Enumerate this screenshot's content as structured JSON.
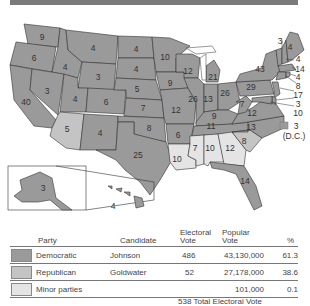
{
  "map": {
    "states": [
      {
        "name": "WA",
        "ev": "9"
      },
      {
        "name": "OR",
        "ev": "6"
      },
      {
        "name": "CA",
        "ev": "40"
      },
      {
        "name": "ID",
        "ev": "4"
      },
      {
        "name": "NV",
        "ev": "3"
      },
      {
        "name": "MT",
        "ev": "4"
      },
      {
        "name": "WY",
        "ev": "3"
      },
      {
        "name": "UT",
        "ev": "4"
      },
      {
        "name": "AZ",
        "ev": "5"
      },
      {
        "name": "CO",
        "ev": "6"
      },
      {
        "name": "NM",
        "ev": "4"
      },
      {
        "name": "ND",
        "ev": "4"
      },
      {
        "name": "SD",
        "ev": "4"
      },
      {
        "name": "NE",
        "ev": "5"
      },
      {
        "name": "KS",
        "ev": "7"
      },
      {
        "name": "OK",
        "ev": "8"
      },
      {
        "name": "TX",
        "ev": "25"
      },
      {
        "name": "MN",
        "ev": "10"
      },
      {
        "name": "IA",
        "ev": "9"
      },
      {
        "name": "MO",
        "ev": "12"
      },
      {
        "name": "AR",
        "ev": "6"
      },
      {
        "name": "LA",
        "ev": "10"
      },
      {
        "name": "WI",
        "ev": "12"
      },
      {
        "name": "IL",
        "ev": "26"
      },
      {
        "name": "MI",
        "ev": "21"
      },
      {
        "name": "IN",
        "ev": "13"
      },
      {
        "name": "OH",
        "ev": "26"
      },
      {
        "name": "KY",
        "ev": "9"
      },
      {
        "name": "TN",
        "ev": "11"
      },
      {
        "name": "MS",
        "ev": "7"
      },
      {
        "name": "AL",
        "ev": "10"
      },
      {
        "name": "GA",
        "ev": "12"
      },
      {
        "name": "FL",
        "ev": "14"
      },
      {
        "name": "SC",
        "ev": "8"
      },
      {
        "name": "NC",
        "ev": "13"
      },
      {
        "name": "VA",
        "ev": "12"
      },
      {
        "name": "WV",
        "ev": "7"
      },
      {
        "name": "PA",
        "ev": "29"
      },
      {
        "name": "NY",
        "ev": "43"
      },
      {
        "name": "VT",
        "ev": "3"
      },
      {
        "name": "ME",
        "ev": "4"
      },
      {
        "name": "NH",
        "ev": "4"
      },
      {
        "name": "MA",
        "ev": "14"
      },
      {
        "name": "RI",
        "ev": "4"
      },
      {
        "name": "CT",
        "ev": "8"
      },
      {
        "name": "NJ",
        "ev": "17"
      },
      {
        "name": "DE",
        "ev": "3"
      },
      {
        "name": "MD",
        "ev": "10"
      },
      {
        "name": "AK",
        "ev": "3"
      },
      {
        "name": "HI",
        "ev": "4"
      }
    ],
    "dc": {
      "ev": "3",
      "label": "(D.C.)"
    }
  },
  "colors": {
    "democratic": "#9a9a9a",
    "republican": "#c4c4c4",
    "minor": "#e4e4e4",
    "border": "#333333"
  },
  "table": {
    "headers": {
      "party": "Party",
      "candidate": "Candidate",
      "electoral_1": "Electoral",
      "electoral_2": "Vote",
      "popular_1": "Popular",
      "popular_2": "Vote",
      "pct": "%"
    },
    "rows": [
      {
        "party": "Democratic",
        "candidate": "Johnson",
        "electoral": "486",
        "popular": "43,130,000",
        "pct": "61.3"
      },
      {
        "party": "Republican",
        "candidate": "Goldwater",
        "electoral": "52",
        "popular": "27,178,000",
        "pct": "38.6"
      },
      {
        "party": "Minor parties",
        "candidate": "",
        "electoral": "",
        "popular": "101,000",
        "pct": "0.1"
      }
    ],
    "total": "538 Total Electoral Vote"
  }
}
